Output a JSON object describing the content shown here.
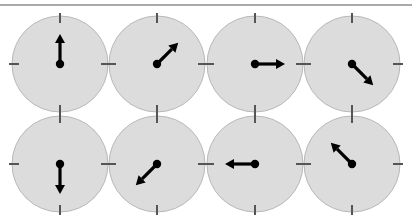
{
  "figure": {
    "colors": {
      "dial_fill": "#dcdcdc",
      "dial_stroke": "#b8b8b8",
      "tick": "#555555",
      "arrow": "#000000",
      "top_rule": "#a9a9a9"
    },
    "dial_radius": 48,
    "arrow_length": 30,
    "dials": [
      {
        "row": 1,
        "col": 1,
        "cx": 60,
        "cy": 64,
        "direction": "up",
        "angle_deg": 0
      },
      {
        "row": 1,
        "col": 2,
        "cx": 157,
        "cy": 64,
        "direction": "up-right",
        "angle_deg": 45
      },
      {
        "row": 1,
        "col": 3,
        "cx": 255,
        "cy": 64,
        "direction": "right",
        "angle_deg": 90
      },
      {
        "row": 1,
        "col": 4,
        "cx": 352,
        "cy": 64,
        "direction": "down-right",
        "angle_deg": 135
      },
      {
        "row": 2,
        "col": 1,
        "cx": 60,
        "cy": 164,
        "direction": "down",
        "angle_deg": 180
      },
      {
        "row": 2,
        "col": 2,
        "cx": 157,
        "cy": 164,
        "direction": "down-left",
        "angle_deg": 225
      },
      {
        "row": 2,
        "col": 3,
        "cx": 255,
        "cy": 164,
        "direction": "left",
        "angle_deg": 270
      },
      {
        "row": 2,
        "col": 4,
        "cx": 352,
        "cy": 164,
        "direction": "up-left",
        "angle_deg": 315
      }
    ]
  }
}
